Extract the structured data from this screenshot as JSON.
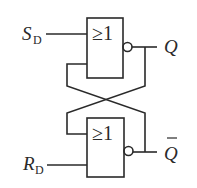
{
  "diagram": {
    "gates": [
      {
        "id": "top",
        "symbol": "≥1",
        "inverted_output": true
      },
      {
        "id": "bottom",
        "symbol": "≥1",
        "inverted_output": true
      }
    ],
    "inputs": {
      "set": {
        "main": "S",
        "sub": "D"
      },
      "reset": {
        "main": "R",
        "sub": "D"
      }
    },
    "outputs": {
      "q": "Q",
      "q_bar": "Q"
    },
    "colors": {
      "line": "#2a2a2a",
      "background": "#ffffff"
    }
  }
}
